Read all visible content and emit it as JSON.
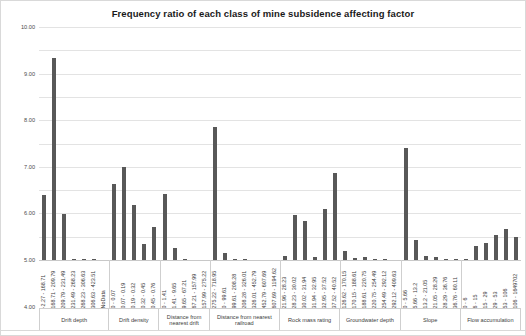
{
  "chart_data": {
    "type": "bar",
    "title": "Frequency ratio of each class of mine subsidence affecting factor",
    "xlabel": "",
    "ylabel": "",
    "ylim": [
      0,
      10
    ],
    "ytick_labels": [
      "0.00",
      "1.00",
      "2.00",
      "3.00",
      "4.00",
      "5.00",
      "6.00",
      "7.00",
      "8.00",
      "9.00",
      "10.00"
    ],
    "ytick_values": [
      0,
      1,
      2,
      3,
      4,
      5,
      6,
      7,
      8,
      9,
      10
    ],
    "grid": true,
    "legend": "none",
    "bar_color": "#585858",
    "groups": [
      {
        "name": "Drift depth",
        "categories": [
          "-2.27 - 168.71",
          "168.71 - 209.79",
          "209.79 - 231.49",
          "231.49 - 268.23",
          "268.23 - 306.63",
          "306.63 - 423.51",
          "NoData"
        ],
        "values": [
          2.78,
          8.66,
          1.97,
          0.04,
          0.03,
          0.02,
          0.0
        ]
      },
      {
        "name": "Drift density",
        "categories": [
          "0 - 0.07",
          "0.07 - 0.19",
          "0.19 - 0.32",
          "0.32 - 0.45",
          "0.45 - 0.76"
        ],
        "values": [
          3.25,
          4.0,
          2.34,
          0.67,
          1.41
        ]
      },
      {
        "name": "Distance from nearest drift",
        "categories": [
          "0 - 1.41",
          "1.41 - 9.65",
          "9.65 - 67.21",
          "67.21 - 157.99",
          "157.99 - 275.22"
        ],
        "values": [
          2.85,
          0.52,
          0.01,
          0.0,
          0.0
        ]
      },
      {
        "name": "Distance from nearest railroad",
        "categories": [
          "275.22 - 718.95",
          "0 - 99.61",
          "99.61 - 208.28",
          "208.28 - 326.01",
          "326.01 - 452.79",
          "452.79 - 607.69",
          "607.69 - 1194.62"
        ],
        "values": [
          5.72,
          0.28,
          0.02,
          0.01,
          0.0,
          0.0,
          0.0
        ]
      },
      {
        "name": "Rock mass rating",
        "categories": [
          "21.96 - 28.23",
          "28.23 - 30.02",
          "30.02 - 31.94",
          "31.94 - 32.95",
          "32.95 - 37.52",
          "37.52 - 40.52"
        ],
        "values": [
          0.18,
          1.95,
          1.67,
          0.15,
          2.18,
          3.72
        ]
      },
      {
        "name": "Groundwater depth",
        "categories": [
          "126.62 - 170.15",
          "170.15 - 188.61",
          "188.61 - 220.75",
          "220.75 - 254.49",
          "254.49 - 292.12",
          "292.12 - 409.63"
        ],
        "values": [
          0.39,
          0.09,
          0.12,
          0.04,
          0.02,
          0.0
        ]
      },
      {
        "name": "Slope",
        "categories": [
          "0 - 5.66",
          "5.66 - 13.2",
          "13.2 - 21.05",
          "21.05 - 28.29",
          "28.29 - 36.76",
          "36.76 - 60.11"
        ],
        "values": [
          4.8,
          0.85,
          0.19,
          0.15,
          0.05,
          0.02
        ]
      },
      {
        "name": "Flow accumulation",
        "categories": [
          "0 - 6",
          "6 - 15",
          "15 - 29",
          "29 - 53",
          "53 - 106",
          "106 - 1649702"
        ],
        "values": [
          0.04,
          0.6,
          0.72,
          1.08,
          1.32,
          1.0
        ]
      }
    ]
  }
}
